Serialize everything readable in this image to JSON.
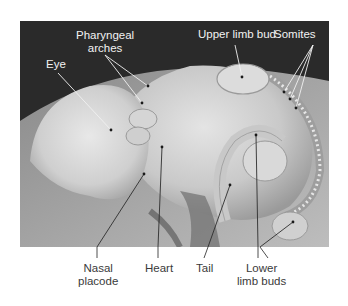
{
  "figure": {
    "labels_top": {
      "eye": "Eye",
      "pharyngeal_arches_line1": "Pharyngeal",
      "pharyngeal_arches_line2": "arches",
      "upper_limb_bud": "Upper limb bud",
      "somites": "Somites"
    },
    "labels_bottom": {
      "nasal_placode_line1": "Nasal",
      "nasal_placode_line2": "placode",
      "heart": "Heart",
      "tail": "Tail",
      "lower_limb_buds_line1": "Lower",
      "lower_limb_buds_line2": "limb buds"
    },
    "colors": {
      "background": "#ffffff",
      "photo_dark_bg": "#2c2c2c",
      "specimen_light": "#d8d8d8",
      "label_light": "#f2f2f2",
      "label_dark": "#3a3a3a"
    }
  }
}
